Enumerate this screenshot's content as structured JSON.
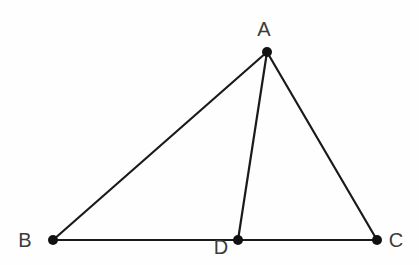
{
  "figure": {
    "kind": "geometry-diagram",
    "shape_description": "Triangle ABC with cevian AD drawn from apex A to point D on base BC",
    "width": 419,
    "height": 265,
    "background_color": "#fefefe",
    "stroke_color": "#1a1a1a",
    "stroke_width": 2.2,
    "point_color": "#111111",
    "point_radius": 5,
    "label_color": "#3b3b3b",
    "label_font_size": 20
  },
  "points": [
    {
      "id": "A",
      "label": "A",
      "x": 267,
      "y": 52,
      "label_x": 264,
      "label_y": 29,
      "dot": true
    },
    {
      "id": "B",
      "label": "B",
      "x": 53,
      "y": 240,
      "label_x": 25,
      "label_y": 240,
      "dot": true
    },
    {
      "id": "C",
      "label": "C",
      "x": 377,
      "y": 240,
      "label_x": 396,
      "label_y": 240,
      "dot": true
    },
    {
      "id": "D",
      "label": "D",
      "x": 238,
      "y": 240,
      "label_x": 221,
      "label_y": 247,
      "dot": true
    }
  ],
  "segments": [
    {
      "id": "AB",
      "from": "A",
      "to": "B",
      "name": "segment-ab"
    },
    {
      "id": "AC",
      "from": "A",
      "to": "C",
      "name": "segment-ac"
    },
    {
      "id": "AD",
      "from": "A",
      "to": "D",
      "name": "segment-ad"
    },
    {
      "id": "BC",
      "from": "B",
      "to": "C",
      "name": "segment-bc"
    }
  ]
}
